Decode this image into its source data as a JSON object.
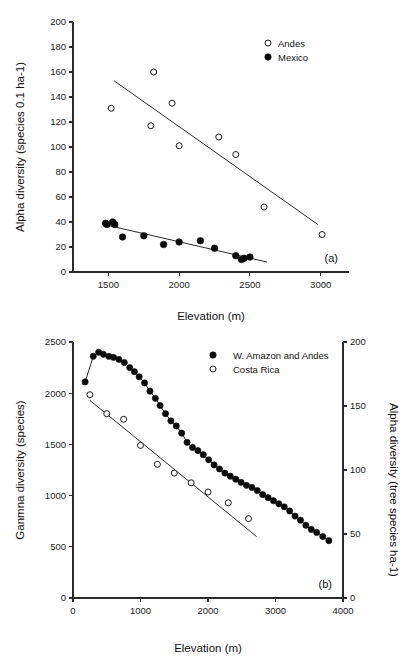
{
  "figure": {
    "background": "#ffffff",
    "marker_filled_color": "#0b0b0b",
    "marker_open_color": "#ffffff",
    "axis_color": "#2b2b2b"
  },
  "panel_a": {
    "label": "(a)",
    "xlabel": "Elevation (m)",
    "ylabel": "Alpha diversity (species 0.1 ha-1)",
    "xticks": [
      "1500",
      "2000",
      "2500",
      "3000"
    ],
    "yticks": [
      "0",
      "20",
      "40",
      "60",
      "80",
      "100",
      "120",
      "140",
      "160",
      "180",
      "200"
    ],
    "legend": [
      {
        "label": "Andes",
        "marker": "open-circle"
      },
      {
        "label": "Mexico",
        "marker": "filled-circle"
      }
    ]
  },
  "panel_b": {
    "label": "(b)",
    "xlabel": "Elevation (m)",
    "ylabel_left": "Ganmna diversity (species)",
    "ylabel_right": "Alpha diversity (tree species ha-1)",
    "xticks": [
      "0",
      "1000",
      "2000",
      "3000",
      "4000"
    ],
    "yticks_left": [
      "0",
      "500",
      "1000",
      "1500",
      "2000",
      "2500"
    ],
    "yticks_right": [
      "0",
      "50",
      "100",
      "150",
      "200"
    ],
    "legend": [
      {
        "label": "W. Amazon and Andes",
        "marker": "filled-circle"
      },
      {
        "label": "Costa Rica",
        "marker": "open-circle"
      }
    ]
  },
  "chart_data": [
    {
      "type": "scatter",
      "panel": "a",
      "title": "",
      "xlabel": "Elevation (m)",
      "ylabel": "Alpha diversity (species 0.1 ha-1)",
      "xlim": [
        1250,
        3200
      ],
      "ylim": [
        0,
        200
      ],
      "xticks": [
        1500,
        2000,
        2500,
        3000
      ],
      "yticks": [
        0,
        20,
        40,
        60,
        80,
        100,
        120,
        140,
        160,
        180,
        200
      ],
      "grid": false,
      "legend_position": "top-right",
      "annotations": [
        "(a)"
      ],
      "series": [
        {
          "name": "Andes",
          "marker": "open-circle",
          "points": [
            [
              1520,
              131
            ],
            [
              1820,
              160
            ],
            [
              1800,
              117
            ],
            [
              1950,
              135
            ],
            [
              2000,
              101
            ],
            [
              2280,
              108
            ],
            [
              2400,
              94
            ],
            [
              2600,
              52
            ],
            [
              3010,
              30
            ]
          ],
          "trendline": {
            "x1": 1540,
            "y1": 153,
            "x2": 2980,
            "y2": 38
          }
        },
        {
          "name": "Mexico",
          "marker": "filled-circle",
          "points": [
            [
              1480,
              39
            ],
            [
              1490,
              38
            ],
            [
              1530,
              40
            ],
            [
              1545,
              38
            ],
            [
              1600,
              28
            ],
            [
              1750,
              29
            ],
            [
              1890,
              22
            ],
            [
              2000,
              24
            ],
            [
              2150,
              25
            ],
            [
              2250,
              19
            ],
            [
              2400,
              13
            ],
            [
              2440,
              10
            ],
            [
              2460,
              11
            ],
            [
              2500,
              12
            ]
          ],
          "trendline": {
            "x1": 1470,
            "y1": 38,
            "x2": 2620,
            "y2": 8
          }
        }
      ]
    },
    {
      "type": "scatter",
      "panel": "b",
      "title": "",
      "xlabel": "Elevation (m)",
      "ylabel_left": "Ganmna diversity (species)",
      "ylabel_right": "Alpha diversity (tree species ha-1)",
      "xlim": [
        0,
        4000
      ],
      "ylim_left": [
        0,
        2500
      ],
      "ylim_right": [
        0,
        200
      ],
      "xticks": [
        0,
        1000,
        2000,
        3000,
        4000
      ],
      "yticks_left": [
        0,
        500,
        1000,
        1500,
        2000,
        2500
      ],
      "yticks_right": [
        0,
        50,
        100,
        150,
        200
      ],
      "grid": false,
      "legend_position": "top-center",
      "annotations": [
        "(b)"
      ],
      "series": [
        {
          "name": "W. Amazon and Andes",
          "marker": "filled-circle",
          "connected": true,
          "axis": "left",
          "points": [
            [
              180,
              2110
            ],
            [
              300,
              2360
            ],
            [
              380,
              2400
            ],
            [
              450,
              2380
            ],
            [
              530,
              2360
            ],
            [
              600,
              2350
            ],
            [
              680,
              2330
            ],
            [
              760,
              2300
            ],
            [
              840,
              2250
            ],
            [
              910,
              2210
            ],
            [
              980,
              2160
            ],
            [
              1060,
              2100
            ],
            [
              1140,
              2020
            ],
            [
              1220,
              1950
            ],
            [
              1290,
              1880
            ],
            [
              1370,
              1800
            ],
            [
              1450,
              1730
            ],
            [
              1530,
              1680
            ],
            [
              1610,
              1610
            ],
            [
              1690,
              1520
            ],
            [
              1770,
              1470
            ],
            [
              1850,
              1440
            ],
            [
              1930,
              1400
            ],
            [
              2010,
              1350
            ],
            [
              2090,
              1300
            ],
            [
              2170,
              1260
            ],
            [
              2250,
              1220
            ],
            [
              2330,
              1190
            ],
            [
              2410,
              1160
            ],
            [
              2490,
              1130
            ],
            [
              2570,
              1100
            ],
            [
              2650,
              1080
            ],
            [
              2730,
              1050
            ],
            [
              2810,
              1010
            ],
            [
              2890,
              980
            ],
            [
              2970,
              950
            ],
            [
              3050,
              920
            ],
            [
              3130,
              890
            ],
            [
              3210,
              850
            ],
            [
              3290,
              800
            ],
            [
              3370,
              760
            ],
            [
              3450,
              710
            ],
            [
              3530,
              670
            ],
            [
              3610,
              640
            ],
            [
              3700,
              600
            ],
            [
              3790,
              560
            ]
          ]
        },
        {
          "name": "Costa Rica",
          "marker": "open-circle",
          "connected": false,
          "axis": "left",
          "points": [
            [
              250,
              1985
            ],
            [
              500,
              1800
            ],
            [
              750,
              1745
            ],
            [
              1000,
              1490
            ],
            [
              1250,
              1305
            ],
            [
              1500,
              1220
            ],
            [
              1750,
              1125
            ],
            [
              2000,
              1035
            ],
            [
              2300,
              930
            ],
            [
              2600,
              775
            ]
          ],
          "trendline": {
            "x1": 250,
            "y1": 1930,
            "x2": 2720,
            "y2": 600
          }
        }
      ]
    }
  ]
}
